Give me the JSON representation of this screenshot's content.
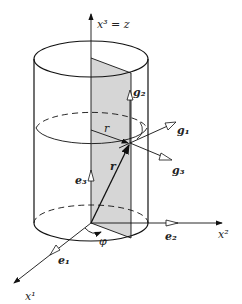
{
  "diagram": {
    "labels": {
      "axis3": "x³ = z",
      "axis2": "x²",
      "axis1": "x¹",
      "g1": "g₁",
      "g2": "g₂",
      "g3": "g₃",
      "e1": "e₁",
      "e2": "e₂",
      "e3": "e₃",
      "r_vec": "r",
      "r_radius": "r",
      "phi": "φ"
    },
    "colors": {
      "line": "#111111",
      "plane_fill": "#d6d6d6",
      "background": "#ffffff"
    }
  }
}
